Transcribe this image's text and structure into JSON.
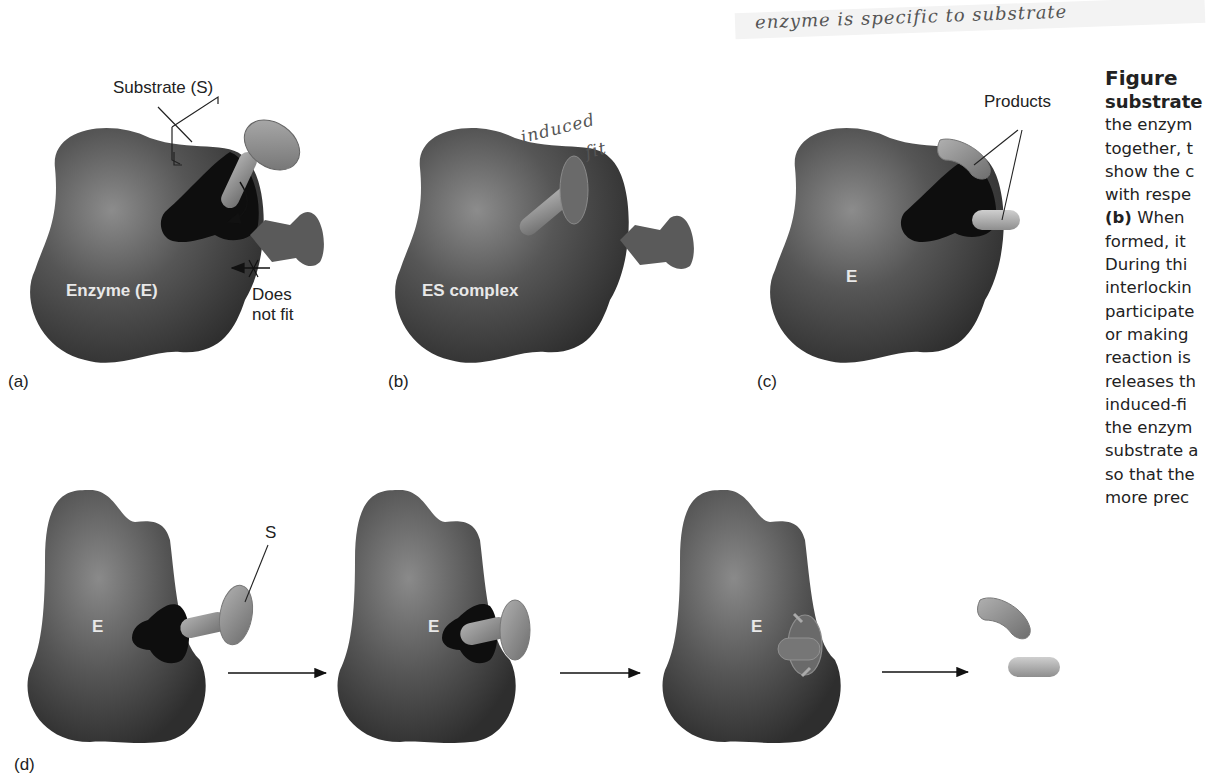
{
  "figure": {
    "panel_labels": {
      "a": "(a)",
      "b": "(b)",
      "c": "(c)",
      "d": "(d)"
    },
    "panel_a": {
      "substrate_label": "Substrate (S)",
      "enzyme_label": "Enzyme (E)",
      "does_not_fit_line1": "Does",
      "does_not_fit_line2": "not fit"
    },
    "panel_b": {
      "complex_label": "ES complex",
      "handwritten_note_line1": "induced",
      "handwritten_note_line2": "fit"
    },
    "panel_c": {
      "enzyme_label": "E",
      "products_label": "Products"
    },
    "panel_d": {
      "enzyme_labels": [
        "E",
        "E",
        "E"
      ],
      "substrate_label": "S"
    },
    "handwritten_top_note": "enzyme is specific to substrate"
  },
  "caption": {
    "title": "Figure",
    "subtitle": "substrate",
    "lines": [
      "the enzym",
      "together, t",
      "show the c",
      "with respe"
    ],
    "bold_b": "(b)",
    "line_after_b": " When",
    "lines2": [
      "formed, it",
      "During thi",
      "interlockin",
      "participate",
      "or making",
      "reaction is",
      "releases th",
      "induced-fi",
      "the enzym",
      "substrate a",
      "so that the",
      "more prec"
    ]
  },
  "colors": {
    "enzyme_dark": "#3d3d3d",
    "enzyme_mid": "#5a5a5a",
    "pocket": "#111111",
    "substrate": "#8a8a8a",
    "substrate_highlight": "#a8a8a8",
    "product_light": "#b5b5b5"
  }
}
